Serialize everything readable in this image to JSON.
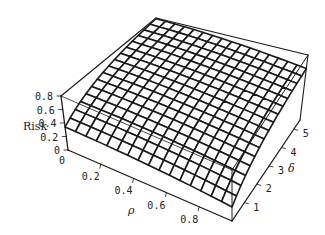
{
  "chart_data": {
    "type": "surface3d",
    "title": "",
    "xlabel": "ρ",
    "ylabel": "δ",
    "zlabel": "Risk",
    "x_ticks": [
      "0.2",
      "0.4",
      "0.6",
      "0.8"
    ],
    "y_ticks": [
      "1",
      "2",
      "3",
      "4",
      "5"
    ],
    "z_ticks": [
      "0",
      "0.2",
      "0.4",
      "0.6",
      "0.8"
    ],
    "xlim": [
      0,
      1
    ],
    "ylim": [
      0,
      5.5
    ],
    "zlim": [
      0,
      0.8
    ],
    "grid_resolution": [
      16,
      16
    ],
    "surface_description": "Risk increases with δ and decreases slightly with ρ; ~0.3 at δ=0, rising to ~0.75–0.8 at δ=5.5",
    "sample_values": [
      {
        "rho": 0.0,
        "delta": 0.0,
        "risk": 0.35
      },
      {
        "rho": 1.0,
        "delta": 0.0,
        "risk": 0.22
      },
      {
        "rho": 0.0,
        "delta": 5.5,
        "risk": 0.78
      },
      {
        "rho": 1.0,
        "delta": 5.5,
        "risk": 0.6
      }
    ],
    "box": true,
    "mesh_color": "#1a1a1a"
  }
}
